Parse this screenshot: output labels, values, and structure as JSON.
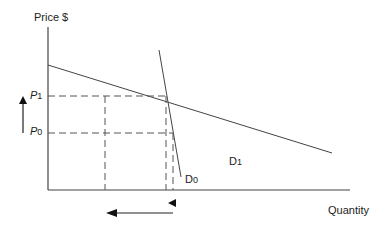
{
  "diagram": {
    "title": "",
    "y_axis_label": "Price $",
    "x_axis_label": "Quantity",
    "price_levels": [
      {
        "id": "P1",
        "letter": "P",
        "sub": "1"
      },
      {
        "id": "P0",
        "letter": "P",
        "sub": "0"
      }
    ],
    "curves": [
      {
        "id": "D1",
        "letter": "D",
        "sub": "1",
        "description": "flatter (more elastic) demand curve"
      },
      {
        "id": "D0",
        "letter": "D",
        "sub": "0",
        "description": "steep (inelastic) demand curve"
      }
    ],
    "annotations": {
      "price_arrow": "up",
      "quantity_arrow": "left"
    },
    "colors": {
      "line": "#444444",
      "background": "#ffffff"
    }
  }
}
